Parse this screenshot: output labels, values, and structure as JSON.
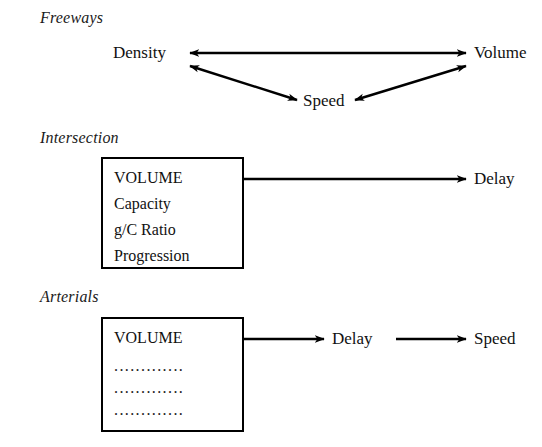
{
  "figure": {
    "type": "diagram",
    "background_color": "#ffffff",
    "line_color": "#000000",
    "text_color": "#111111"
  },
  "sections": [
    {
      "id": "freeways",
      "label": "Freeways",
      "nodes": [
        {
          "id": "freeways-density",
          "label": "Density"
        },
        {
          "id": "freeways-volume",
          "label": "Volume"
        },
        {
          "id": "freeways-speed",
          "label": "Speed"
        }
      ],
      "relations": [
        {
          "from": "Density",
          "to": "Volume",
          "style": "double-headed"
        },
        {
          "from": "Density",
          "to": "Speed",
          "style": "double-headed"
        },
        {
          "from": "Speed",
          "to": "Volume",
          "style": "double-headed"
        }
      ]
    },
    {
      "id": "intersection",
      "label": "Intersection",
      "box": {
        "id": "intersection-box",
        "lines": [
          "VOLUME",
          "Capacity",
          "g/C Ratio",
          "Progression"
        ]
      },
      "nodes": [
        {
          "id": "intersection-delay",
          "label": "Delay"
        }
      ],
      "relations": [
        {
          "from": "intersection-box",
          "to": "Delay",
          "style": "single-headed"
        }
      ]
    },
    {
      "id": "arterials",
      "label": "Arterials",
      "box": {
        "id": "arterials-box",
        "lines": [
          "VOLUME"
        ],
        "placeholder_rows": [
          ".............",
          ".............",
          "............."
        ]
      },
      "nodes": [
        {
          "id": "arterials-delay",
          "label": "Delay"
        },
        {
          "id": "arterials-speed",
          "label": "Speed"
        }
      ],
      "relations": [
        {
          "from": "arterials-box",
          "to": "Delay",
          "style": "single-headed"
        },
        {
          "from": "Delay",
          "to": "Speed",
          "style": "single-headed"
        }
      ]
    }
  ]
}
